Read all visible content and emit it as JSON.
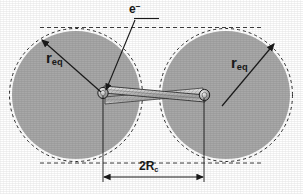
{
  "figure": {
    "background_color": "#ffffff",
    "sphere_fill_color": "#a8a8a8",
    "line_color": "#1a1a1a",
    "labels": {
      "radius_left": {
        "base": "r",
        "subscript": "eq"
      },
      "radius_right": {
        "base": "r",
        "subscript": "eq"
      },
      "electron": {
        "base": "e",
        "superscript": "−"
      },
      "contact_diameter": {
        "prefix": "2",
        "base": "R",
        "subscript": "c"
      }
    },
    "shapes": {
      "left_sphere": {
        "cx": 76,
        "cy": 95,
        "r": 64
      },
      "right_sphere": {
        "cx": 226,
        "cy": 95,
        "r": 64
      },
      "dashed_outline_offset": 2,
      "neck_left_x": 103,
      "neck_right_x": 204,
      "neck_y": 93,
      "dimension_line_y": 177,
      "top_dashed_line_y": 21,
      "bottom_dashed_line_y": 168
    }
  }
}
